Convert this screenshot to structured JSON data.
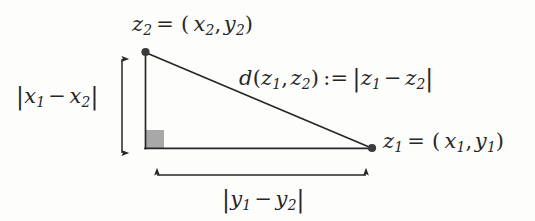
{
  "figure": {
    "name": "right-triangle-distance-diagram",
    "background_color": "#fdfdfc",
    "stroke_color": "#262626",
    "right_angle_marker_color": "#a8a8a8",
    "vertices": {
      "top": {
        "x": 145,
        "y": 52,
        "label_key": "z2"
      },
      "corner": {
        "x": 145,
        "y": 148
      },
      "right": {
        "x": 372,
        "y": 148,
        "label_key": "z1"
      }
    },
    "right_angle_marker": {
      "x": 146,
      "y": 130,
      "width": 18,
      "height": 18
    },
    "vertical_arrow": {
      "x": 122,
      "y_top": 52,
      "y_bottom": 158
    },
    "horizontal_arrow": {
      "y": 175,
      "x_left": 150,
      "x_right": 372
    }
  },
  "labels": {
    "z2": {
      "text": "z2 = (x2, y2)",
      "var": "z",
      "sub": "2",
      "open": "= (",
      "x_var": "x",
      "x_sub": "2",
      "comma": ",",
      "y_var": "y",
      "y_sub": "2",
      "close": ")"
    },
    "z1": {
      "text": "z1 = (x1, y1)",
      "var": "z",
      "sub": "1",
      "open": "= (",
      "x_var": "x",
      "x_sub": "1",
      "comma": ",",
      "y_var": "y",
      "y_sub": "1",
      "close": ")"
    },
    "distance": {
      "text": "d(z1, z2) := |z1 - z2|",
      "d": "d",
      "paren_open": "(",
      "arg1": "z",
      "arg1_sub": "1",
      "comma": ",",
      "arg2": "z",
      "arg2_sub": "2",
      "paren_close": ")",
      "defines": ":=",
      "bar_open": "|",
      "term1": "z",
      "term1_sub": "1",
      "minus": "−",
      "term2": "z",
      "term2_sub": "2",
      "bar_close": "|"
    },
    "delta_x": {
      "text": "|x1 - x2|",
      "bar_open": "|",
      "term1": "x",
      "term1_sub": "1",
      "minus": "−",
      "term2": "x",
      "term2_sub": "2",
      "bar_close": "|"
    },
    "delta_y": {
      "text": "|y1 - y2|",
      "bar_open": "|",
      "term1": "y",
      "term1_sub": "1",
      "minus": "−",
      "term2": "y",
      "term2_sub": "2",
      "bar_close": "|"
    }
  }
}
